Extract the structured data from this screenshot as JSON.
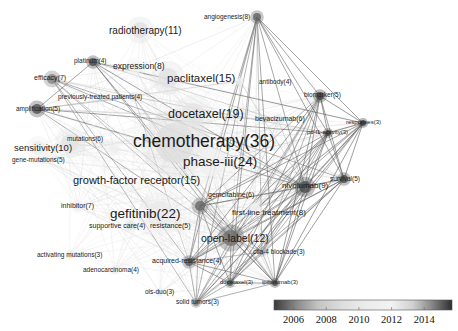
{
  "diagram": {
    "type": "keyword co-occurrence network",
    "nodes": [
      {
        "id": "chemotherapy",
        "label": "chemotherapy(36)",
        "count": 36,
        "year": 2009.0
      },
      {
        "id": "phase-iii",
        "label": "phase-iii(24)",
        "count": 24,
        "year": 2011.5
      },
      {
        "id": "gefitinib",
        "label": "gefitinib(22)",
        "count": 22,
        "year": 2010.3
      },
      {
        "id": "docetaxel",
        "label": "docetaxel(19)",
        "count": 19,
        "year": 2009.8
      },
      {
        "id": "paclitaxel",
        "label": "paclitaxel(15)",
        "count": 15,
        "year": 2009.4
      },
      {
        "id": "growth-factor-receptor",
        "label": "growth-factor receptor(15)",
        "count": 15,
        "year": 2009.6
      },
      {
        "id": "open-label",
        "label": "open-label(12)",
        "count": 12,
        "year": 2014.8
      },
      {
        "id": "radiotherapy",
        "label": "radiotherapy(11)",
        "count": 11,
        "year": 2009.3
      },
      {
        "id": "sensitivity",
        "label": "sensitivity(10)",
        "count": 10,
        "year": 2011.0
      },
      {
        "id": "nivolumab",
        "label": "nivolumab(9)",
        "count": 9,
        "year": 2015.3
      },
      {
        "id": "angiogenesis",
        "label": "angiogenesis(8)",
        "count": 8,
        "year": 2015.0
      },
      {
        "id": "expression",
        "label": "expression(8)",
        "count": 8,
        "year": 2011.6
      },
      {
        "id": "first-line-treatment",
        "label": "first-line treatment(8)",
        "count": 8,
        "year": 2012.0
      },
      {
        "id": "efficacy",
        "label": "efficacy(7)",
        "count": 7,
        "year": 2014.5
      },
      {
        "id": "inhibitor",
        "label": "inhibitor(7)",
        "count": 7,
        "year": 2010.8
      },
      {
        "id": "mutations",
        "label": "mutations(6)",
        "count": 6,
        "year": 2011.2
      },
      {
        "id": "gemcitabine",
        "label": "gemcitabine(6)",
        "count": 6,
        "year": 2014.9
      },
      {
        "id": "bevacizumab",
        "label": "bevacizumab(6)",
        "count": 6,
        "year": 2012.5
      },
      {
        "id": "amplification",
        "label": "amplification(5)",
        "count": 5,
        "year": 2015.2
      },
      {
        "id": "gene-mutations",
        "label": "gene-mutations(5)",
        "count": 5,
        "year": 2011.4
      },
      {
        "id": "resistance",
        "label": "resistance(5)",
        "count": 5,
        "year": 2010.5
      },
      {
        "id": "biomarker",
        "label": "biomarker(5)",
        "count": 5,
        "year": 2015.4
      },
      {
        "id": "survival",
        "label": "survival(5)",
        "count": 5,
        "year": 2015.3
      },
      {
        "id": "platinum",
        "label": "platinum(4)",
        "count": 4,
        "year": 2015.3
      },
      {
        "id": "previously-treated-patients",
        "label": "previously-treated patients(4)",
        "count": 4,
        "year": 2012.8
      },
      {
        "id": "antibody",
        "label": "antibody(4)",
        "count": 4,
        "year": 2012.2
      },
      {
        "id": "supportive-care",
        "label": "supportive care(4)",
        "count": 4,
        "year": 2009.5
      },
      {
        "id": "acquired-resistance",
        "label": "acquired-resistance(4)",
        "count": 4,
        "year": 2015.1
      },
      {
        "id": "adenocarcinoma",
        "label": "adenocarcinoma(4)",
        "count": 4,
        "year": 2010.2
      },
      {
        "id": "responses",
        "label": "responses(3)",
        "count": 3,
        "year": 2015.5
      },
      {
        "id": "pd-l1-activity",
        "label": "pd-l1-activity(3)",
        "count": 3,
        "year": 2015.4
      },
      {
        "id": "activating-mutations",
        "label": "activating mutations(3)",
        "count": 3,
        "year": 2010.0
      },
      {
        "id": "ctla-4-blockade",
        "label": "ctla-4 blockade(3)",
        "count": 3,
        "year": 2014.0
      },
      {
        "id": "ipilimumab",
        "label": "ipilimumab(3)",
        "count": 3,
        "year": 2015.3
      },
      {
        "id": "docetaxel-3",
        "label": "docetaxel(3)",
        "count": 3,
        "year": 2015.2
      },
      {
        "id": "ols-duo",
        "label": "ols-duo(3)",
        "count": 3,
        "year": 2011.0
      },
      {
        "id": "solid-tumors",
        "label": "solid tumors(3)",
        "count": 3,
        "year": 2014.6
      }
    ]
  },
  "colorbar": {
    "ticks": [
      "2006",
      "2008",
      "2010",
      "2012",
      "2014"
    ],
    "range": [
      2004.8,
      2015.7
    ],
    "stops": [
      {
        "year": 2004.8,
        "color": "#3a3a3a"
      },
      {
        "year": 2006.2,
        "color": "#8a8a8a"
      },
      {
        "year": 2007.5,
        "color": "#c4c4c4"
      },
      {
        "year": 2009.0,
        "color": "#dedede"
      },
      {
        "year": 2010.5,
        "color": "#ececec"
      },
      {
        "year": 2012.0,
        "color": "#f2f2f2"
      },
      {
        "year": 2013.3,
        "color": "#d0d0d0"
      },
      {
        "year": 2014.4,
        "color": "#8c8c8c"
      },
      {
        "year": 2015.7,
        "color": "#2e2e2e"
      }
    ]
  }
}
